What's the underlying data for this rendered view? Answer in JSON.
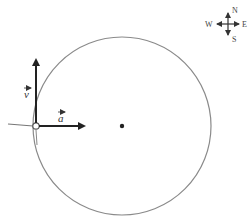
{
  "diagram": {
    "type": "circular-motion-vectors",
    "circle": {
      "cx": 122,
      "cy": 126,
      "r": 89,
      "stroke": "#888888"
    },
    "center_dot": {
      "x": 122,
      "y": 126
    },
    "object_point": {
      "x": 36,
      "y": 126
    },
    "vectors": [
      {
        "id": "v",
        "label": "v",
        "direction": "up",
        "from": [
          36,
          126
        ],
        "to": [
          36,
          57
        ]
      },
      {
        "id": "a",
        "label": "a",
        "direction": "right",
        "from": [
          36,
          126
        ],
        "to": [
          87,
          126
        ]
      }
    ],
    "compass": {
      "north": "N",
      "south": "S",
      "east": "E",
      "west": "W",
      "center": [
        228,
        24
      ]
    }
  }
}
